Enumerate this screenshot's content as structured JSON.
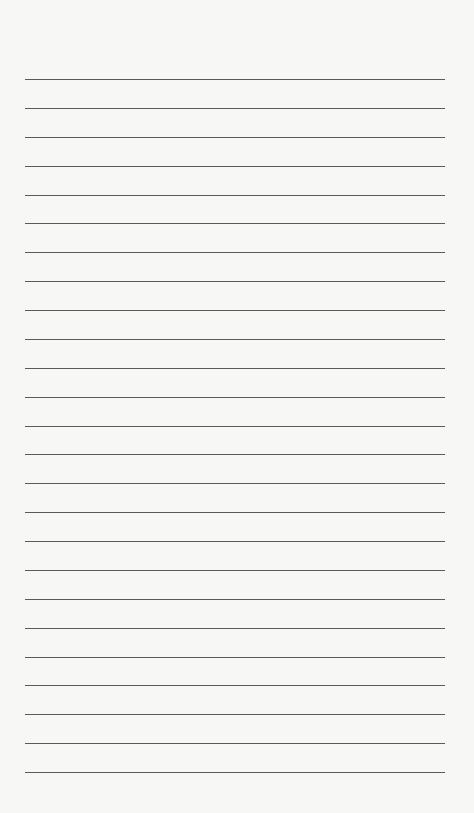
{
  "page": {
    "type": "lined-paper",
    "background_color": "#f7f7f6",
    "line_color": "#5a5a5a",
    "line_count": 25,
    "first_line_y": 79,
    "line_spacing": 28.875,
    "line_left": 25,
    "line_width": 420
  }
}
